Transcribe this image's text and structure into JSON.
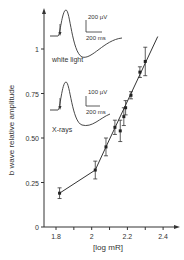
{
  "chart_data": {
    "type": "line",
    "title": "",
    "xlabel": "[log mR]",
    "ylabel": "b wave relative amplitude",
    "xlim": [
      1.75,
      2.45
    ],
    "ylim": [
      0,
      1.1
    ],
    "x_ticks": [
      "1.8",
      "2",
      "2.2",
      "2.4"
    ],
    "y_ticks": [
      "0",
      "0.25",
      "0.50",
      "0.75",
      "1"
    ],
    "grid": false,
    "series": [
      {
        "name": "X-rays",
        "x": [
          1.82,
          2.02,
          2.08,
          2.13,
          2.16,
          2.18,
          2.19,
          2.22,
          2.27,
          2.3
        ],
        "y": [
          0.19,
          0.32,
          0.45,
          0.56,
          0.54,
          0.62,
          0.67,
          0.74,
          0.87,
          0.93
        ],
        "err": [
          0.03,
          0.05,
          0.05,
          0.04,
          0.06,
          0.05,
          0.04,
          0.02,
          0.03,
          0.08
        ]
      }
    ],
    "insets": [
      {
        "label": "white light",
        "scale_v": "200 µV",
        "scale_t": "200 ms"
      },
      {
        "label": "X-rays",
        "scale_v": "100 µV",
        "scale_t": "200 ms"
      }
    ]
  }
}
